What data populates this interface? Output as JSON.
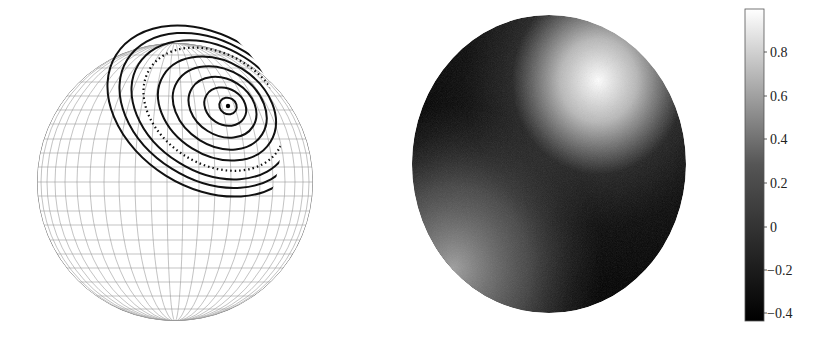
{
  "figure": {
    "left_panel": {
      "name": "wireframe-sphere-with-contours",
      "center_dot": true,
      "ring_count": 9,
      "dotted_ring_index": 6
    },
    "right_panel": {
      "name": "shaded-sphere-scalar-field"
    },
    "colorbar": {
      "ticks": [
        "0.8",
        "0.6",
        "0.4",
        "0.2",
        "0",
        "−0.2",
        "−0.4"
      ],
      "min": -0.45,
      "max": 1.0,
      "colors": {
        "low": "#000000",
        "high": "#ffffff"
      }
    }
  }
}
